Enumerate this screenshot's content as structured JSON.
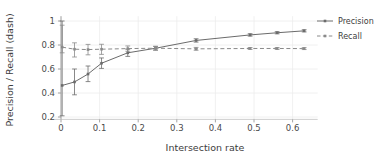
{
  "chart_data": {
    "type": "line",
    "title": "",
    "xlabel": "Intersection rate",
    "ylabel": "Precision / Recall (dash)",
    "xlim": [
      -0.02,
      0.665
    ],
    "ylim": [
      0.18,
      1.04
    ],
    "xticks": [
      "0",
      "0.1",
      "0.2",
      "0.3",
      "0.4",
      "0.5",
      "0.6"
    ],
    "xtick_values": [
      0,
      0.1,
      0.2,
      0.3,
      0.4,
      0.5,
      0.6
    ],
    "yticks": [
      "0.2",
      "0.4",
      "0.6",
      "0.8",
      "1"
    ],
    "ytick_values": [
      0.2,
      0.4,
      0.6,
      0.8,
      1.0
    ],
    "grid": true,
    "legend_position": "right",
    "x": [
      0.003,
      0.035,
      0.07,
      0.105,
      0.173,
      0.245,
      0.35,
      0.49,
      0.56,
      0.63
    ],
    "series": [
      {
        "name": "Precision",
        "style": "solid",
        "color": "#6b6b6b",
        "values": [
          0.463,
          0.492,
          0.558,
          0.648,
          0.735,
          0.773,
          0.838,
          0.884,
          0.902,
          0.918
        ],
        "err_low": [
          0.21,
          0.385,
          0.495,
          0.605,
          0.705,
          0.757,
          0.824,
          0.874,
          0.893,
          0.909
        ],
        "err_high": [
          1.0,
          0.6,
          0.625,
          0.692,
          0.765,
          0.789,
          0.852,
          0.894,
          0.911,
          0.927
        ]
      },
      {
        "name": "Recall",
        "style": "dashed",
        "color": "#8a8a8a",
        "values": [
          0.782,
          0.765,
          0.762,
          0.765,
          0.77,
          0.773,
          0.768,
          0.771,
          0.771,
          0.77
        ],
        "err_low": [
          0.735,
          0.7,
          0.718,
          0.722,
          0.748,
          0.758,
          0.756,
          0.763,
          0.763,
          0.762
        ],
        "err_high": [
          0.965,
          0.818,
          0.805,
          0.806,
          0.792,
          0.788,
          0.78,
          0.779,
          0.779,
          0.778
        ]
      }
    ]
  },
  "legend": {
    "items": [
      {
        "label": "Precision"
      },
      {
        "label": "Recall"
      }
    ]
  },
  "axes": {
    "x_title": "Intersection rate",
    "y_title": "Precision / Recall (dash)"
  }
}
